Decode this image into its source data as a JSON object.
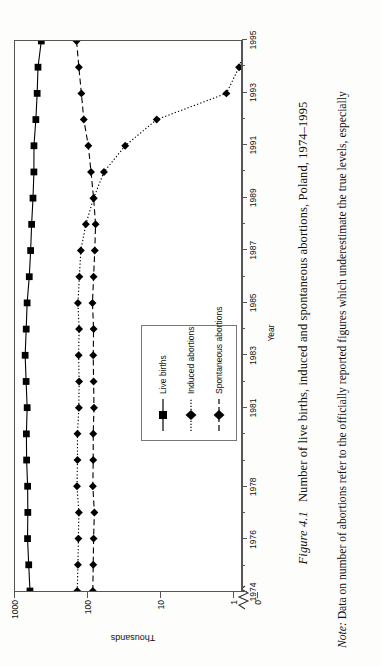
{
  "figure": {
    "number_label": "Figure 4.1",
    "caption": "Number of live births, induced and spontaneous abortions, Poland, 1974–1995",
    "note_label": "Note:",
    "note_text": "Data on number of abortions refer to the officially reported figures which underestimate the true levels, especially"
  },
  "legend": {
    "items": [
      {
        "label": "Live births",
        "marker": "square-marker",
        "line": "solid",
        "color": "#000000"
      },
      {
        "label": "Induced abortions",
        "marker": "diamond-marker",
        "line": "dotted",
        "color": "#000000"
      },
      {
        "label": "Spontaneous abortions",
        "marker": "diamond-marker",
        "line": "dashed",
        "color": "#000000"
      }
    ]
  },
  "chart_data": {
    "type": "line",
    "title": "Number of live births, induced and spontaneous abortions, Poland, 1974–1995",
    "xlabel": "Year",
    "ylabel": "Thousands",
    "yscale": "log",
    "ylim": [
      1,
      1000
    ],
    "y_tick_labels": [
      "1000",
      "100",
      "10",
      "1",
      "0"
    ],
    "y_axis_break": true,
    "grid": false,
    "legend_position": "bottom-left-inside",
    "x": [
      1974,
      1975,
      1976,
      1977,
      1978,
      1979,
      1980,
      1981,
      1982,
      1983,
      1984,
      1985,
      1986,
      1987,
      1988,
      1989,
      1990,
      1991,
      1992,
      1993,
      1994,
      1995
    ],
    "x_tick_labels": [
      "1974",
      "1976",
      "1978",
      "1981",
      "1983",
      "1985",
      "1987",
      "1989",
      "1991",
      "1993",
      "1995"
    ],
    "x_tick_years": [
      1974,
      1976,
      1978,
      1981,
      1983,
      1985,
      1987,
      1989,
      1991,
      1993,
      1995
    ],
    "series": [
      {
        "name": "Live births",
        "marker": "square-marker",
        "line": "solid",
        "values": [
          621,
          646,
          671,
          665,
          669,
          691,
          696,
          679,
          702,
          724,
          700,
          680,
          635,
          608,
          589,
          564,
          548,
          547,
          515,
          494,
          481,
          433
        ]
      },
      {
        "name": "Induced abortions",
        "marker": "diamond-marker",
        "line": "dotted",
        "values": [
          138,
          135,
          133,
          131,
          139,
          137,
          137,
          131,
          130,
          132,
          130,
          135,
          129,
          123,
          105,
          82,
          59,
          30,
          11,
          1.2,
          0.8,
          0.6
        ]
      },
      {
        "name": "Spontaneous abortions",
        "marker": "diamond-marker",
        "line": "dashed",
        "values": [
          84,
          83,
          82,
          80,
          84,
          83,
          83,
          81,
          82,
          83,
          82,
          85,
          82,
          79,
          77,
          82,
          89,
          97,
          112,
          121,
          131,
          141
        ]
      }
    ]
  }
}
